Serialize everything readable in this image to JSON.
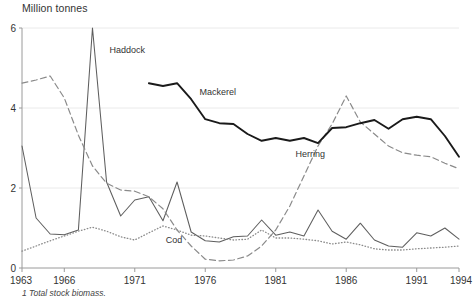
{
  "title": "Million tonnes",
  "footnote": "1 Total stock biomass.",
  "chart_data": {
    "type": "line",
    "title": "Million tonnes",
    "subtitle": "",
    "xlabel": "",
    "ylabel": "Million tonnes",
    "xlim": [
      1963,
      1994
    ],
    "ylim": [
      0,
      6
    ],
    "yticks": [
      0,
      2,
      4,
      6
    ],
    "ytick_labels": [
      "0",
      "2",
      "4",
      "6"
    ],
    "xticks": [
      1963,
      1966,
      1971,
      1976,
      1981,
      1986,
      1991,
      1994
    ],
    "xtick_labels": [
      "1963",
      "1966",
      "1971",
      "1976",
      "1981",
      "1986",
      "1991",
      "1994"
    ],
    "grid": true,
    "grid_axis": "y",
    "legend": "inline-annotations",
    "annotations": [
      {
        "text": "Haddock",
        "x": 1969.2,
        "y": 5.38
      },
      {
        "text": "Mackerel",
        "x": 1975.6,
        "y": 4.33
      },
      {
        "text": "Herring",
        "x": 1982.4,
        "y": 2.78
      },
      {
        "text": "Cod",
        "x": 1973.2,
        "y": 0.63
      }
    ],
    "series": [
      {
        "name": "Haddock",
        "style": "solid",
        "color": "#5e5e5e",
        "x": [
          1963,
          1964,
          1965,
          1966,
          1967,
          1968,
          1969,
          1970,
          1971,
          1972,
          1973,
          1974,
          1975,
          1976,
          1977,
          1978,
          1979,
          1980,
          1981,
          1982,
          1983,
          1984,
          1985,
          1986,
          1987,
          1988,
          1989,
          1990,
          1991,
          1992,
          1993,
          1994
        ],
        "values": [
          3.05,
          1.25,
          0.85,
          0.83,
          0.95,
          6.0,
          2.15,
          1.3,
          1.7,
          1.78,
          1.18,
          2.15,
          0.9,
          0.68,
          0.65,
          0.78,
          0.8,
          1.2,
          0.82,
          0.9,
          0.8,
          1.45,
          0.92,
          0.72,
          1.12,
          0.7,
          0.55,
          0.52,
          0.88,
          0.8,
          1.0,
          0.72
        ]
      },
      {
        "name": "Herring",
        "style": "dashed",
        "color": "#8a8a8a",
        "x": [
          1963,
          1964,
          1965,
          1966,
          1967,
          1968,
          1969,
          1970,
          1971,
          1972,
          1973,
          1974,
          1975,
          1976,
          1977,
          1978,
          1979,
          1980,
          1981,
          1982,
          1983,
          1984,
          1985,
          1986,
          1987,
          1988,
          1989,
          1990,
          1991,
          1992,
          1993,
          1994
        ],
        "values": [
          4.62,
          4.7,
          4.8,
          4.25,
          3.32,
          2.55,
          2.12,
          1.95,
          1.92,
          1.78,
          1.48,
          0.95,
          0.55,
          0.22,
          0.18,
          0.2,
          0.3,
          0.55,
          0.95,
          1.55,
          2.3,
          3.05,
          3.6,
          4.3,
          3.65,
          3.35,
          3.05,
          2.88,
          2.82,
          2.78,
          2.62,
          2.48
        ]
      },
      {
        "name": "Mackerel",
        "style": "solid-bold",
        "color": "#1a1a1a",
        "x": [
          1972,
          1973,
          1974,
          1975,
          1976,
          1977,
          1978,
          1979,
          1980,
          1981,
          1982,
          1983,
          1984,
          1985,
          1986,
          1987,
          1988,
          1989,
          1990,
          1991,
          1992,
          1993,
          1994
        ],
        "values": [
          4.62,
          4.55,
          4.62,
          4.22,
          3.72,
          3.62,
          3.6,
          3.35,
          3.18,
          3.25,
          3.18,
          3.25,
          3.12,
          3.5,
          3.52,
          3.62,
          3.7,
          3.48,
          3.72,
          3.78,
          3.72,
          3.3,
          2.78
        ]
      },
      {
        "name": "Cod",
        "style": "dotted",
        "color": "#8a8a8a",
        "x": [
          1963,
          1964,
          1965,
          1966,
          1967,
          1968,
          1969,
          1970,
          1971,
          1972,
          1973,
          1974,
          1975,
          1976,
          1977,
          1978,
          1979,
          1980,
          1981,
          1982,
          1983,
          1984,
          1985,
          1986,
          1987,
          1988,
          1989,
          1990,
          1991,
          1992,
          1993,
          1994
        ],
        "values": [
          0.42,
          0.55,
          0.68,
          0.8,
          0.92,
          1.02,
          0.92,
          0.78,
          0.7,
          0.88,
          1.05,
          0.95,
          0.82,
          0.8,
          0.75,
          0.7,
          0.72,
          0.95,
          0.75,
          0.75,
          0.72,
          0.68,
          0.6,
          0.65,
          0.58,
          0.48,
          0.45,
          0.45,
          0.48,
          0.5,
          0.52,
          0.55
        ]
      }
    ]
  }
}
